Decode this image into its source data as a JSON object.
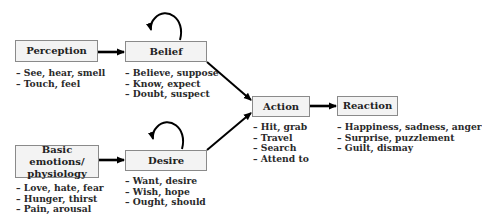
{
  "nodes": {
    "perception": {
      "label": "Perception",
      "items": [
        "See, hear, smell",
        "Touch, feel"
      ]
    },
    "belief": {
      "label": "Belief",
      "items": [
        "Believe, suppose",
        "Know, expect",
        "Doubt, suspect"
      ]
    },
    "basic": {
      "label_line1": "Basic emotions/",
      "label_line2": "physiology",
      "items": [
        "Love, hate, fear",
        "Hunger, thirst",
        "Pain, arousal"
      ]
    },
    "desire": {
      "label": "Desire",
      "items": [
        "Want, desire",
        "Wish, hope",
        "Ought, should"
      ]
    },
    "action": {
      "label": "Action",
      "items": [
        "Hit, grab",
        "Travel",
        "Search",
        "Attend to"
      ]
    },
    "reaction": {
      "label": "Reaction",
      "items": [
        "Happiness, sadness, anger",
        "Surprise, puzzlement",
        "Guilt, dismay"
      ]
    }
  },
  "edges": [
    {
      "from": "perception",
      "to": "belief"
    },
    {
      "from": "belief",
      "to": "belief",
      "type": "self-loop"
    },
    {
      "from": "basic",
      "to": "desire"
    },
    {
      "from": "desire",
      "to": "desire",
      "type": "self-loop"
    },
    {
      "from": "belief",
      "to": "action"
    },
    {
      "from": "desire",
      "to": "action"
    },
    {
      "from": "action",
      "to": "reaction"
    }
  ]
}
